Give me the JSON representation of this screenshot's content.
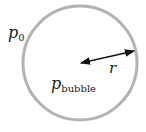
{
  "diagram": {
    "title": "",
    "labels": {
      "outside_pressure": {
        "base": "p",
        "subscript": "0"
      },
      "inside_pressure": {
        "base": "p",
        "subscript": "bubble"
      },
      "radius": "r"
    },
    "colors": {
      "circle": "#b3b3b3",
      "arrow": "#111111",
      "text": "#1a1a1a"
    }
  }
}
